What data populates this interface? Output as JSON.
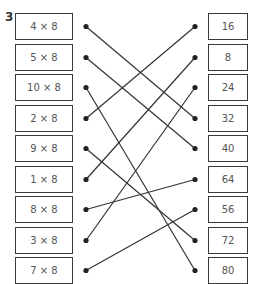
{
  "question_number": "3",
  "left_items": [
    "4 × 8",
    "5 × 8",
    "10 × 8",
    "2 × 8",
    "9 × 8",
    "1 × 8",
    "8 × 8",
    "3 × 8",
    "7 × 8"
  ],
  "right_items": [
    "16",
    "8",
    "24",
    "32",
    "40",
    "64",
    "56",
    "72",
    "80"
  ],
  "connections": [
    [
      0,
      3
    ],
    [
      1,
      4
    ],
    [
      2,
      8
    ],
    [
      3,
      0
    ],
    [
      4,
      7
    ],
    [
      5,
      1
    ],
    [
      6,
      5
    ],
    [
      7,
      2
    ],
    [
      8,
      6
    ]
  ],
  "colors": {
    "line": "#333333",
    "border": "#3a3a3a",
    "text": "#555555"
  }
}
